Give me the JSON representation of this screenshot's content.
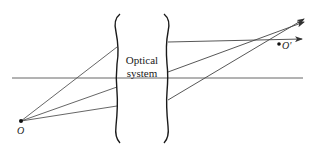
{
  "diagram": {
    "system_label_line1": "Optical",
    "system_label_line2": "system",
    "object_point_label": "O",
    "image_point_label": "O'",
    "colors": {
      "line": "#555555",
      "brace": "#1a1a1a",
      "point": "#111111",
      "background": "#ffffff"
    },
    "object_point": {
      "x": 21,
      "y": 121
    },
    "image_point": {
      "x": 279,
      "y": 44
    },
    "optical_axis": {
      "x1": 12,
      "y1": 78,
      "x2": 303,
      "y2": 78
    },
    "left_brace": {
      "x": 117,
      "y_top": 14,
      "y_bottom": 143
    },
    "right_brace": {
      "x": 167,
      "y_top": 14,
      "y_bottom": 143
    },
    "incoming_rays": [
      {
        "from": [
          21,
          121
        ],
        "to": [
          117,
          47
        ]
      },
      {
        "from": [
          21,
          121
        ],
        "to": [
          117,
          87
        ]
      },
      {
        "from": [
          21,
          121
        ],
        "to": [
          117,
          106
        ]
      }
    ],
    "outgoing_rays": [
      {
        "from": [
          168,
          42
        ],
        "to": [
          302,
          39
        ]
      },
      {
        "from": [
          168,
          72
        ],
        "to": [
          304,
          22
        ]
      },
      {
        "from": [
          168,
          100
        ],
        "to": [
          304,
          19
        ]
      }
    ]
  }
}
